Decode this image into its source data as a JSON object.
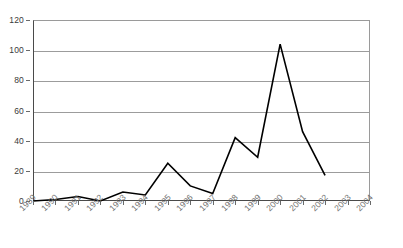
{
  "chart_data": {
    "type": "line",
    "title": "",
    "subtitle": "",
    "xlabel": "",
    "ylabel": "",
    "x": [
      "1989",
      "1990",
      "1991",
      "1992",
      "1993",
      "1994",
      "1995",
      "1996",
      "1997",
      "1998",
      "1999",
      "2000",
      "2001",
      "2002",
      "2003",
      "2004"
    ],
    "categories": [
      "1989",
      "1990",
      "1991",
      "1992",
      "1993",
      "1994",
      "1995",
      "1996",
      "1997",
      "1998",
      "1999",
      "2000",
      "2001",
      "2002",
      "2003",
      "2004"
    ],
    "values": [
      0,
      1,
      3,
      0,
      6,
      4,
      25,
      10,
      5,
      42,
      29,
      104,
      46,
      17,
      null,
      null
    ],
    "series": [
      {
        "name": "",
        "values": [
          0,
          1,
          3,
          0,
          6,
          4,
          25,
          10,
          5,
          42,
          29,
          104,
          46,
          17,
          null,
          null
        ]
      }
    ],
    "xlim": [
      0,
      15
    ],
    "ylim": [
      0,
      120
    ],
    "ytick_labels": [
      "0",
      "20",
      "40",
      "60",
      "80",
      "100",
      "120"
    ],
    "ytick_values": [
      0,
      20,
      40,
      60,
      80,
      100,
      120
    ],
    "xtick_labels": [
      "1989",
      "1990",
      "1991",
      "1992",
      "1993",
      "1994",
      "1995",
      "1996",
      "1997",
      "1998",
      "1999",
      "2000",
      "2001",
      "2002",
      "2003",
      "2004"
    ],
    "grid": true,
    "grid_axis": "y",
    "legend": false,
    "legend_position": "none",
    "annotations": [],
    "line_color": "#000000",
    "grid_color": "#9c9c9c",
    "axis_color": "#4a4a4a",
    "label_color": "#707070",
    "ytick_label_color": "#3a3a3a",
    "background_color": "#ffffff"
  }
}
